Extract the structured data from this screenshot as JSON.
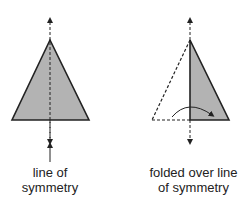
{
  "diagram": {
    "colors": {
      "fill": "#b3b3b3",
      "stroke": "#222222",
      "background": "#ffffff"
    },
    "figures": [
      {
        "id": "left",
        "description": "Isosceles triangle with vertical dashed line of symmetry through apex; arrow pointing up to the line from caption",
        "caption_line1": "line of",
        "caption_line2": "symmetry"
      },
      {
        "id": "right",
        "description": "Triangle folded along line of symmetry; left half shown dashed, curved arrow shows fold direction",
        "caption_line1": "folded over line",
        "caption_line2": "of symmetry"
      }
    ]
  }
}
